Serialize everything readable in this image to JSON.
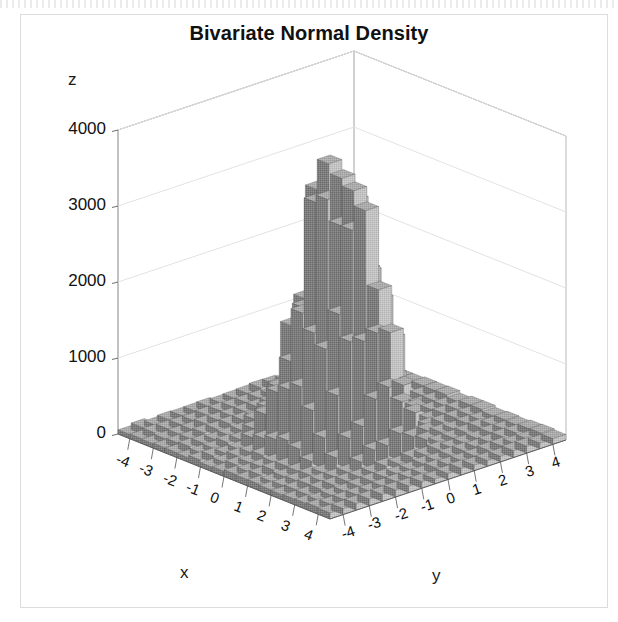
{
  "figure": {
    "title": "Bivariate Normal Density",
    "background_color": "#ffffff",
    "frame_color": "#dcdcdc",
    "bar_left_color": "#808080",
    "bar_right_color": "#c0c0c0",
    "bar_top_color": "#a8a8a8",
    "axis_color": "#555555",
    "grid_color": "#e2e2e2"
  },
  "axes": {
    "z": {
      "label": "z",
      "ticks": [
        "0",
        "1000",
        "2000",
        "3000",
        "4000"
      ],
      "tick_values": [
        0,
        1000,
        2000,
        3000,
        4000
      ],
      "range": [
        0,
        4000
      ]
    },
    "x": {
      "label": "x",
      "ticks": [
        "-4",
        "-3",
        "-2",
        "-1",
        "0",
        "1",
        "2",
        "3",
        "4"
      ],
      "tick_values": [
        -4,
        -3,
        -2,
        -1,
        0,
        1,
        2,
        3,
        4
      ],
      "range": [
        -4.5,
        4.5
      ]
    },
    "y": {
      "label": "y",
      "ticks": [
        "-4",
        "-3",
        "-2",
        "-1",
        "0",
        "1",
        "2",
        "3",
        "4"
      ],
      "tick_values": [
        -4,
        -3,
        -2,
        -1,
        0,
        1,
        2,
        3,
        4
      ],
      "range": [
        -4.5,
        4.5
      ]
    }
  },
  "chart_data": {
    "type": "bar",
    "title": "Bivariate Normal Density",
    "subtitle": "",
    "xlabel": "x",
    "ylabel": "y",
    "zlabel": "z",
    "projection": "3d",
    "grid": true,
    "legend": "none",
    "xlim": [
      -4.5,
      4.5
    ],
    "ylim": [
      -4.5,
      4.5
    ],
    "zlim": [
      0,
      4000
    ],
    "bin_width": 0.5,
    "peak_value": 3800,
    "peak_location": [
      0,
      0
    ],
    "distribution": {
      "family": "bivariate-normal",
      "mean_x": 0,
      "mean_y": 0,
      "sigma_x": 1,
      "sigma_y": 1,
      "correlation": 0,
      "amplitude": 3800
    },
    "x_bin_centers": [
      -4.25,
      -3.75,
      -3.25,
      -2.75,
      -2.25,
      -1.75,
      -1.25,
      -0.75,
      -0.25,
      0.25,
      0.75,
      1.25,
      1.75,
      2.25,
      2.75,
      3.25,
      3.75,
      4.25
    ],
    "y_bin_centers": [
      -4.25,
      -3.75,
      -3.25,
      -2.75,
      -2.25,
      -1.75,
      -1.25,
      -0.75,
      -0.25,
      0.25,
      0.75,
      1.25,
      1.75,
      2.25,
      2.75,
      3.25,
      3.75,
      4.25
    ],
    "z_profile_along_x_at_y0": [
      2,
      8,
      30,
      96,
      250,
      560,
      1100,
      2000,
      3200,
      3800,
      3100,
      1950,
      1050,
      530,
      240,
      92,
      28,
      7
    ],
    "z_profile_along_y_at_x0": [
      3,
      9,
      32,
      100,
      260,
      575,
      1120,
      2050,
      3250,
      3800,
      3050,
      1900,
      1020,
      510,
      230,
      88,
      26,
      6
    ]
  }
}
